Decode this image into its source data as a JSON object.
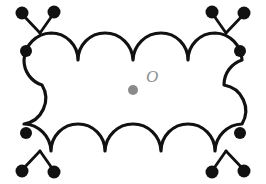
{
  "figure": {
    "background_color": "#ffffff",
    "stroke_color": "#111111",
    "center": {
      "label": "O",
      "label_color": "#8f8f8f",
      "dot_color": "#8a8a8a",
      "dot_x": 133,
      "dot_y": 90,
      "dot_radius": 5,
      "label_x": 146,
      "label_y": 82
    },
    "outline": {
      "description": "closed curve with four convex scallops on top, four on bottom, S-curves at left and right sides",
      "top_scallop_count": 4,
      "bottom_scallop_count": 4,
      "side_curve_type": "s-curve",
      "cusp_positions_x": [
        78,
        133,
        188
      ],
      "top_band_y": 33,
      "bottom_band_y": 151
    },
    "corners": [
      {
        "name": "top-left-bug",
        "position": "top-left",
        "eye_x": 26,
        "eye_y": 51,
        "eye_radius": 6,
        "antenna_joint_x": 40,
        "antenna_joint_y": 33,
        "antenna_tips": [
          {
            "x": 22,
            "y": 13,
            "radius": 6.5
          },
          {
            "x": 54,
            "y": 12,
            "radius": 6.5
          }
        ]
      },
      {
        "name": "top-right-bug",
        "position": "top-right",
        "eye_x": 240,
        "eye_y": 51,
        "eye_radius": 6,
        "antenna_joint_x": 226,
        "antenna_joint_y": 33,
        "antenna_tips": [
          {
            "x": 212,
            "y": 12,
            "radius": 6.5
          },
          {
            "x": 244,
            "y": 13,
            "radius": 6.5
          }
        ]
      },
      {
        "name": "bottom-left-bug",
        "position": "bottom-left",
        "eye_x": 26,
        "eye_y": 133,
        "eye_radius": 6,
        "antenna_joint_x": 40,
        "antenna_joint_y": 151,
        "antenna_tips": [
          {
            "x": 22,
            "y": 171,
            "radius": 6.5
          },
          {
            "x": 54,
            "y": 172,
            "radius": 6.5
          }
        ]
      },
      {
        "name": "bottom-right-bug",
        "position": "bottom-right",
        "eye_x": 240,
        "eye_y": 133,
        "eye_radius": 6,
        "antenna_joint_x": 226,
        "antenna_joint_y": 151,
        "antenna_tips": [
          {
            "x": 212,
            "y": 172,
            "radius": 6.5
          },
          {
            "x": 244,
            "y": 171,
            "radius": 6.5
          }
        ]
      }
    ]
  }
}
